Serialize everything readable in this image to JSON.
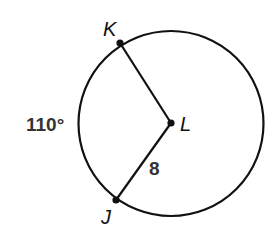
{
  "diagram": {
    "type": "circle-with-central-angle",
    "circle": {
      "center_label": "L",
      "radius_label": "8"
    },
    "points": [
      {
        "label": "K",
        "role": "point-on-circle"
      },
      {
        "label": "L",
        "role": "center"
      },
      {
        "label": "J",
        "role": "point-on-circle"
      }
    ],
    "arc": {
      "from": "K",
      "to": "J",
      "measure_label": "110°"
    },
    "segments": [
      {
        "from": "K",
        "to": "L"
      },
      {
        "from": "L",
        "to": "J",
        "length_label": "8"
      }
    ],
    "colors": {
      "stroke": "#111111",
      "label": "#333333"
    }
  }
}
